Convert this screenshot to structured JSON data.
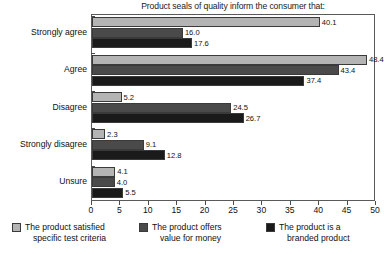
{
  "chart_data": {
    "type": "bar",
    "orientation": "horizontal",
    "title": "Product seals of quality inform the consumer that:",
    "xlabel": "",
    "ylabel": "",
    "xlim": [
      0,
      50
    ],
    "xticks": [
      0,
      5,
      10,
      15,
      20,
      25,
      30,
      35,
      40,
      45,
      50
    ],
    "grid": false,
    "legend_position": "bottom",
    "categories": [
      "Strongly agree",
      "Agree",
      "Disagree",
      "Strongly disagree",
      "Unsure"
    ],
    "series": [
      {
        "name": "The product satisfied specific test criteria",
        "name_line1": "The product satisfied",
        "name_line2": "specific test criteria",
        "color": "#b4b4b4",
        "values": [
          40.1,
          48.4,
          5.2,
          2.3,
          4.1
        ],
        "labels": [
          "40.1",
          "48.4",
          "5.2",
          "2.3",
          "4.1"
        ]
      },
      {
        "name": "The product offers value for money",
        "name_line1": "The product offers",
        "name_line2": "value for money",
        "color": "#4a4a4a",
        "values": [
          16.0,
          43.4,
          24.5,
          9.1,
          4.0
        ],
        "labels": [
          "16.0",
          "43.4",
          "24.5",
          "9.1",
          "4.0"
        ]
      },
      {
        "name": "The product is a branded product",
        "name_line1": "The product is a",
        "name_line2": "branded product",
        "color": "#1a1a1a",
        "values": [
          17.6,
          37.4,
          26.7,
          12.8,
          5.5
        ],
        "labels": [
          "17.6",
          "37.4",
          "26.7",
          "12.8",
          "5.5"
        ]
      }
    ]
  },
  "axis": {
    "tick_labels": [
      "0",
      "5",
      "10",
      "15",
      "20",
      "25",
      "30",
      "35",
      "40",
      "45",
      "50"
    ]
  }
}
